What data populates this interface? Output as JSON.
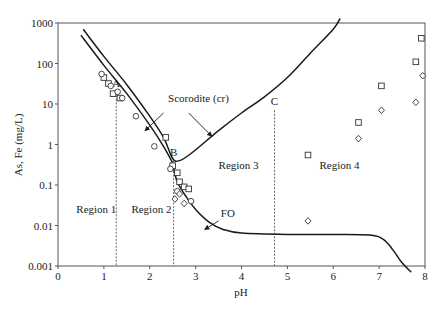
{
  "chart_data": {
    "type": "scatter",
    "title": "",
    "xlabel": "pH",
    "ylabel": "As, Fe (mg/L)",
    "xlim": [
      0,
      8
    ],
    "ylim": [
      0.001,
      1000
    ],
    "yscale": "log",
    "grid": false,
    "x_ticks": [
      0,
      1,
      2,
      3,
      4,
      5,
      6,
      7,
      8
    ],
    "y_ticks": [
      {
        "value": 1000,
        "label": "1000"
      },
      {
        "value": 100,
        "label": "100"
      },
      {
        "value": 10,
        "label": "10"
      },
      {
        "value": 1,
        "label": "1"
      },
      {
        "value": 0.1,
        "label": "0.1"
      },
      {
        "value": 0.01,
        "label": "0.01"
      },
      {
        "value": 0.001,
        "label": "0.001"
      }
    ],
    "curves": [
      {
        "name": "Scorodite (cr) upper",
        "points": [
          [
            0.55,
            700
          ],
          [
            1.0,
            150
          ],
          [
            1.5,
            30
          ],
          [
            2.0,
            5
          ],
          [
            2.3,
            1.5
          ],
          [
            2.5,
            0.45
          ],
          [
            2.65,
            0.4
          ],
          [
            2.9,
            0.6
          ],
          [
            3.5,
            2.2
          ],
          [
            4.0,
            6
          ],
          [
            4.5,
            15
          ],
          [
            5.0,
            45
          ],
          [
            5.5,
            180
          ],
          [
            6.0,
            700
          ],
          [
            6.15,
            1300
          ]
        ]
      },
      {
        "name": "Scorodite (cr) lower",
        "points": [
          [
            0.5,
            500
          ],
          [
            1.0,
            90
          ],
          [
            1.5,
            18
          ],
          [
            2.0,
            3
          ],
          [
            2.3,
            0.9
          ],
          [
            2.5,
            0.35
          ]
        ]
      },
      {
        "name": "FO",
        "points": [
          [
            2.5,
            0.33
          ],
          [
            2.6,
            0.12
          ],
          [
            2.8,
            0.05
          ],
          [
            3.0,
            0.025
          ],
          [
            3.3,
            0.012
          ],
          [
            3.6,
            0.008
          ],
          [
            4.0,
            0.0065
          ],
          [
            5.0,
            0.006
          ],
          [
            6.0,
            0.006
          ],
          [
            6.8,
            0.0058
          ],
          [
            7.1,
            0.0045
          ],
          [
            7.3,
            0.0025
          ],
          [
            7.5,
            0.0012
          ],
          [
            7.7,
            0.0007
          ]
        ]
      }
    ],
    "series": [
      {
        "name": "squares",
        "marker": "square",
        "points": [
          [
            1.0,
            45
          ],
          [
            1.1,
            32
          ],
          [
            1.2,
            18
          ],
          [
            1.35,
            14
          ],
          [
            2.35,
            1.5
          ],
          [
            2.5,
            0.3
          ],
          [
            2.6,
            0.2
          ],
          [
            2.65,
            0.12
          ],
          [
            2.75,
            0.09
          ],
          [
            2.85,
            0.08
          ],
          [
            5.45,
            0.55
          ],
          [
            6.55,
            3.5
          ],
          [
            7.05,
            28
          ],
          [
            7.8,
            110
          ],
          [
            7.92,
            420
          ]
        ]
      },
      {
        "name": "circles",
        "marker": "circle",
        "points": [
          [
            0.95,
            55
          ],
          [
            1.15,
            28
          ],
          [
            1.3,
            20
          ],
          [
            1.4,
            14
          ],
          [
            1.7,
            5
          ],
          [
            2.1,
            0.9
          ],
          [
            2.45,
            0.25
          ],
          [
            2.6,
            0.07
          ],
          [
            2.9,
            0.04
          ]
        ]
      },
      {
        "name": "diamonds",
        "marker": "diamond",
        "points": [
          [
            2.55,
            0.045
          ],
          [
            2.65,
            0.06
          ],
          [
            2.75,
            0.035
          ],
          [
            5.45,
            0.013
          ],
          [
            6.55,
            1.4
          ],
          [
            7.05,
            7
          ],
          [
            7.8,
            11
          ],
          [
            7.95,
            50
          ]
        ]
      }
    ],
    "vertical_lines": [
      {
        "label": "A",
        "x": 1.27,
        "top": 20
      },
      {
        "label": "B",
        "x": 2.52,
        "top": 0.4
      },
      {
        "label": "C",
        "x": 4.72,
        "top": 7
      }
    ],
    "region_labels": [
      {
        "label": "Region 1",
        "x": 0.4,
        "y": 0.02
      },
      {
        "label": "Region 2",
        "x": 1.6,
        "y": 0.02
      },
      {
        "label": "Region 3",
        "x": 3.5,
        "y": 0.25
      },
      {
        "label": "Region 4",
        "x": 5.7,
        "y": 0.25
      }
    ],
    "annotations": [
      {
        "label": "Scorodite (cr)",
        "x": 2.4,
        "y": 11,
        "arrows": [
          [
            [
              2.3,
              6
            ],
            [
              1.9,
              2.2
            ]
          ],
          [
            [
              2.85,
              6
            ],
            [
              3.35,
              1.6
            ]
          ]
        ]
      },
      {
        "label": "FO",
        "x": 3.55,
        "y": 0.016,
        "arrows": [
          [
            [
              3.5,
              0.013
            ],
            [
              3.2,
              0.008
            ]
          ]
        ]
      }
    ]
  }
}
